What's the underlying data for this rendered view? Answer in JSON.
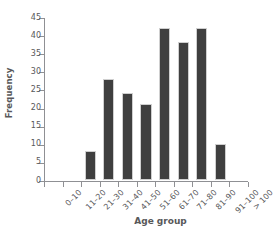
{
  "chart_data": {
    "type": "bar",
    "title": "",
    "xlabel": "Age group",
    "ylabel": "Frequency",
    "categories": [
      "0–10",
      "11–20",
      "21–30",
      "31–40",
      "41–50",
      "51–60",
      "61–70",
      "71–80",
      "81–90",
      "91–100",
      "> 100"
    ],
    "values": [
      0,
      0,
      8,
      28,
      24,
      21,
      42,
      38,
      42,
      10,
      0
    ],
    "ylim": [
      0,
      45
    ],
    "ytick_step": 5,
    "yticks": [
      0,
      5,
      10,
      15,
      20,
      25,
      30,
      35,
      40,
      45
    ],
    "ytick_labels": [
      "0",
      "5",
      "10",
      "15",
      "20",
      "25",
      "30",
      "35",
      "40",
      "45"
    ],
    "grid": false,
    "legend": false,
    "bar_color": "#3f3f3f",
    "axis_color": "#8f9094",
    "text_color": "#58585a",
    "background": "#ffffff"
  }
}
